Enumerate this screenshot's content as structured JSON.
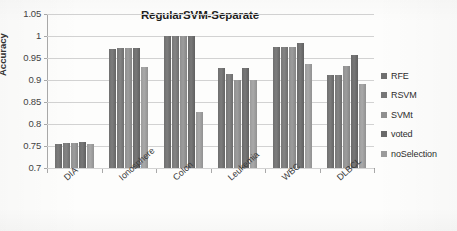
{
  "chart_data": {
    "type": "bar",
    "title": "RegularSVM-Separate",
    "xlabel": "",
    "ylabel": "Accuracy",
    "ylim": [
      0.7,
      1.05
    ],
    "ytick_labels": [
      "1.05",
      "1",
      "0.95",
      "0.9",
      "0.85",
      "0.8",
      "0.75",
      "0.7"
    ],
    "ytick_values": [
      1.05,
      1.0,
      0.95,
      0.9,
      0.85,
      0.8,
      0.75,
      0.7
    ],
    "grid": true,
    "legend_position": "right",
    "categories": [
      "DIA",
      "Ionosphere",
      "Colon",
      "Leukemia",
      "WBC",
      "DLBCL"
    ],
    "series": [
      {
        "name": "RFE",
        "color": "#6f6f6f",
        "values": [
          0.754,
          0.971,
          1.0,
          0.928,
          0.975,
          0.911
        ]
      },
      {
        "name": "RSVM",
        "color": "#777777",
        "values": [
          0.757,
          0.972,
          1.0,
          0.914,
          0.976,
          0.911
        ]
      },
      {
        "name": "SVMt",
        "color": "#8f8f8f",
        "values": [
          0.756,
          0.972,
          1.0,
          0.9,
          0.976,
          0.932
        ]
      },
      {
        "name": "voted",
        "color": "#6a6a6a",
        "values": [
          0.758,
          0.972,
          1.0,
          0.928,
          0.984,
          0.956
        ]
      },
      {
        "name": "noSelection",
        "color": "#9b9b9b",
        "values": [
          0.755,
          0.929,
          0.827,
          0.901,
          0.937,
          0.89
        ]
      }
    ]
  },
  "legend": {
    "items": [
      {
        "label": "RFE"
      },
      {
        "label": "RSVM"
      },
      {
        "label": "SVMt"
      },
      {
        "label": "voted"
      },
      {
        "label": "noSelection"
      }
    ]
  }
}
